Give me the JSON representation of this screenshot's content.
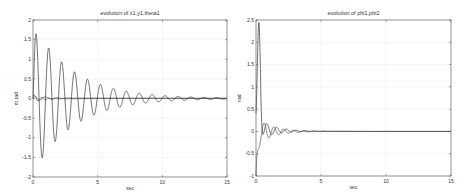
{
  "chart_data": [
    {
      "type": "line",
      "title": "evolution of x1,y1,theta1",
      "xlabel": "sec",
      "ylabel": "m,rad",
      "xlim": [
        0,
        15
      ],
      "ylim": [
        -2,
        2
      ],
      "xticks": [
        "0",
        "5",
        "10",
        "15"
      ],
      "yticks": [
        "-2",
        "-1.5",
        "-1",
        "-0.5",
        "0",
        "0.5",
        "1",
        "1.5",
        "2"
      ],
      "grid": true,
      "legend": null,
      "series": [
        {
          "name": "x1",
          "description": "damped oscillation, period ~1s, first peak ~1.75 at t~0.2, first trough ~-1.75 at t~0.7, decays to ~0 by t~12",
          "x": [
            0,
            0.2,
            0.7,
            1.2,
            1.7,
            2.2,
            2.7,
            3.2,
            3.7,
            4.2,
            4.7,
            5.2,
            5.7,
            6.2,
            6.7,
            7.2,
            7.7,
            8.2,
            8.7,
            9.2,
            10,
            12,
            15
          ],
          "y": [
            0,
            1.75,
            -1.75,
            0.8,
            -0.8,
            0.55,
            -0.55,
            0.4,
            -0.4,
            0.3,
            -0.3,
            0.22,
            -0.22,
            0.17,
            -0.17,
            0.13,
            -0.13,
            0.09,
            -0.09,
            0.06,
            0.03,
            0.01,
            0
          ]
        },
        {
          "name": "y1",
          "description": "small transient near 0",
          "x": [
            0,
            0.3,
            0.6,
            1,
            2,
            15
          ],
          "y": [
            0,
            -0.08,
            0.08,
            -0.02,
            0,
            0
          ]
        },
        {
          "name": "theta1",
          "description": "small transient near 0",
          "x": [
            0,
            0.4,
            0.8,
            1.5,
            3,
            15
          ],
          "y": [
            0,
            0.1,
            -0.05,
            0.03,
            0,
            0
          ]
        }
      ]
    },
    {
      "type": "line",
      "title": "evolution of phi1,phi2",
      "xlabel": "sec",
      "ylabel": "rad",
      "xlim": [
        0,
        15
      ],
      "ylim": [
        -1,
        2.5
      ],
      "xticks": [
        "0",
        "5",
        "10",
        "15"
      ],
      "yticks": [
        "-1",
        "-0.5",
        "0",
        "0.5",
        "1",
        "1.5",
        "2",
        "2.5"
      ],
      "grid": true,
      "legend": null,
      "series": [
        {
          "name": "phi1",
          "description": "rises to ~2.4 at t~0.2 then decays with small oscillations around 0",
          "x": [
            0,
            0.2,
            0.5,
            0.8,
            1.2,
            1.6,
            2.0,
            2.4,
            2.8,
            3.2,
            4,
            6,
            15
          ],
          "y": [
            0,
            2.4,
            0.9,
            0.05,
            0.35,
            0.15,
            0.12,
            -0.02,
            0.08,
            0.02,
            0.04,
            0.01,
            0
          ]
        },
        {
          "name": "phi2",
          "description": "starts ~-1, small oscillations converging to 0",
          "x": [
            0,
            0.4,
            0.7,
            1.0,
            1.4,
            1.8,
            2.2,
            2.6,
            3.0,
            3.5,
            4,
            6,
            15
          ],
          "y": [
            -1,
            0.08,
            -0.42,
            0.05,
            -0.12,
            0.1,
            -0.08,
            0.08,
            -0.05,
            0.05,
            -0.03,
            0.01,
            0
          ]
        }
      ]
    }
  ]
}
